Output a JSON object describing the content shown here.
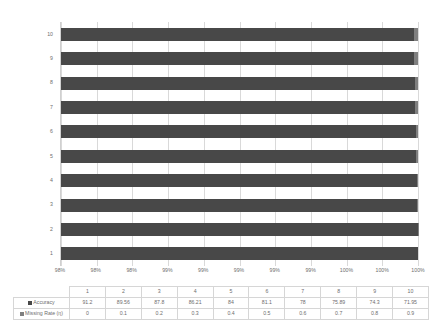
{
  "chart_data": {
    "type": "bar",
    "subtype": "stacked-horizontal-100pct",
    "title": "",
    "xlabel": "",
    "ylabel": "",
    "orientation": "horizontal",
    "stacked": true,
    "grid": true,
    "legend_position": "table-row-headers",
    "categories": [
      "1",
      "2",
      "3",
      "4",
      "5",
      "6",
      "7",
      "8",
      "9",
      "10"
    ],
    "category_display_order": [
      "10",
      "9",
      "8",
      "7",
      "6",
      "5",
      "4",
      "3",
      "2",
      "1"
    ],
    "series": [
      {
        "name": "Accuracy",
        "color": "#484848",
        "values": [
          91.2,
          89.56,
          87.8,
          86.21,
          84,
          81.1,
          78,
          75.89,
          74.3,
          71.95
        ]
      },
      {
        "name": "Missing Rate (η)",
        "color": "#7f7f7f",
        "values": [
          0,
          0.1,
          0.2,
          0.3,
          0.4,
          0.5,
          0.6,
          0.7,
          0.8,
          0.9
        ]
      }
    ],
    "x_tick_labels": [
      "98%",
      "98%",
      "98%",
      "99%",
      "99%",
      "99%",
      "99%",
      "99%",
      "100%",
      "100%",
      "100%"
    ],
    "xlim": [
      98,
      100
    ]
  },
  "table": {
    "corner_label": "",
    "column_headers": [
      "1",
      "2",
      "3",
      "4",
      "5",
      "6",
      "7",
      "8",
      "9",
      "10"
    ],
    "rows": [
      {
        "label": "Accuracy",
        "swatch": "accuracy-legend-swatch",
        "values": [
          "91.2",
          "89.56",
          "87.8",
          "86.21",
          "84",
          "81.1",
          "78",
          "75.89",
          "74.3",
          "71.95"
        ]
      },
      {
        "label": "Missing Rate (η)",
        "swatch": "missing-rate-legend-swatch",
        "values": [
          "0",
          "0.1",
          "0.2",
          "0.3",
          "0.4",
          "0.5",
          "0.6",
          "0.7",
          "0.8",
          "0.9"
        ]
      }
    ]
  }
}
